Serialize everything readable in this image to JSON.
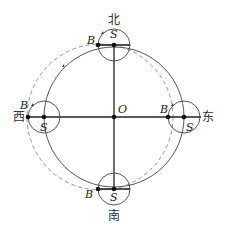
{
  "diagram": {
    "center_label": "O",
    "directions": {
      "north": "北",
      "south": "南",
      "east": "东",
      "west": "西"
    },
    "sun_label": "S",
    "point_label": "B",
    "colors": {
      "line": "#333333",
      "dashed": "#888888"
    }
  }
}
